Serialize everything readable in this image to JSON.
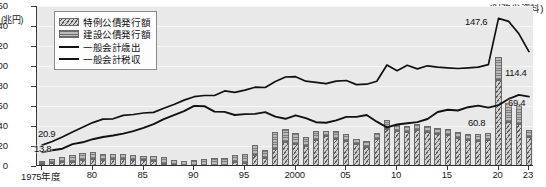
{
  "axis": {
    "y_unit": "(兆円)",
    "y_ticks": [
      0,
      20,
      40,
      60,
      80,
      100,
      120,
      140,
      160
    ],
    "x_ticks": [
      "1975年度",
      "80",
      "85",
      "90",
      "95",
      "2000",
      "05",
      "10",
      "15",
      "20",
      "23"
    ],
    "x_tick_years": [
      1975,
      1980,
      1985,
      1990,
      1995,
      2000,
      2005,
      2010,
      2015,
      2020,
      2023
    ]
  },
  "source": "(財務省資料)",
  "legend": [
    {
      "key": "toku",
      "label": "特例公債発行額",
      "type": "bar-hatch"
    },
    {
      "key": "kensetsu",
      "label": "建設公債発行額",
      "type": "bar-solid"
    },
    {
      "key": "saishutsu",
      "label": "一般会計歳出",
      "type": "line"
    },
    {
      "key": "zeishu",
      "label": "一般会計税収",
      "type": "line"
    }
  ],
  "callouts": [
    {
      "name": "saishutsu-start",
      "text": "20.9",
      "x": 38,
      "y": 128
    },
    {
      "name": "zeishu-start",
      "text": "13.8",
      "x": 34,
      "y": 143
    },
    {
      "name": "saishutsu-peak",
      "text": "147.6",
      "x": 465,
      "y": 16
    },
    {
      "name": "saishutsu-end",
      "text": "114.4",
      "x": 505,
      "y": 67
    },
    {
      "name": "zeishu-mid",
      "text": "60.8",
      "x": 468,
      "y": 117
    },
    {
      "name": "zeishu-end",
      "text": "69.4",
      "x": 508,
      "y": 97
    }
  ],
  "chart_data": {
    "type": "bar",
    "title": "",
    "subtitle": "",
    "xlabel": "",
    "ylabel": "(兆円)",
    "ylim": [
      0,
      160
    ],
    "grid": true,
    "legend_position": "top-left",
    "note": "Stacked bars = government bond issuance (special-deficit bonds hatched, construction bonds solid); two overlaid lines = general-account expenditure and tax revenue. Japan fiscal years 1975-2023, units trillion yen.",
    "categories": [
      1975,
      1976,
      1977,
      1978,
      1979,
      1980,
      1981,
      1982,
      1983,
      1984,
      1985,
      1986,
      1987,
      1988,
      1989,
      1990,
      1991,
      1992,
      1993,
      1994,
      1995,
      1996,
      1997,
      1998,
      1999,
      2000,
      2001,
      2002,
      2003,
      2004,
      2005,
      2006,
      2007,
      2008,
      2009,
      2010,
      2011,
      2012,
      2013,
      2014,
      2015,
      2016,
      2017,
      2018,
      2019,
      2020,
      2021,
      2022,
      2023
    ],
    "series": [
      {
        "name": "特例公債発行額",
        "type": "bar",
        "stack": "bonds",
        "values": [
          2.1,
          3.5,
          4.5,
          4.4,
          6.3,
          7.2,
          5.9,
          7.0,
          6.9,
          6.4,
          6.0,
          5.0,
          2.5,
          1.5,
          0.2,
          0.0,
          0.0,
          0.0,
          0.0,
          4.1,
          2.8,
          11.0,
          8.5,
          16.9,
          24.3,
          21.8,
          20.3,
          25.8,
          30.0,
          27.0,
          25.3,
          21.9,
          19.3,
          26.9,
          36.9,
          34.7,
          34.4,
          36.0,
          33.8,
          32.0,
          30.9,
          28.0,
          26.2,
          25.5,
          25.7,
          86.0,
          43.6,
          42.3,
          29.1
        ]
      },
      {
        "name": "建設公債発行額",
        "type": "bar",
        "stack": "bonds",
        "values": [
          3.1,
          3.6,
          5.0,
          6.4,
          7.1,
          7.0,
          6.0,
          5.4,
          5.1,
          4.3,
          4.3,
          4.6,
          6.9,
          5.0,
          5.2,
          6.3,
          6.7,
          7.6,
          8.1,
          6.5,
          9.4,
          10.0,
          7.1,
          17.0,
          13.2,
          11.1,
          8.7,
          9.0,
          5.4,
          8.0,
          6.5,
          5.5,
          6.0,
          6.3,
          9.0,
          6.4,
          6.1,
          5.9,
          6.2,
          6.0,
          6.0,
          6.0,
          6.1,
          6.1,
          7.1,
          22.6,
          19.0,
          20.0,
          6.6
        ]
      },
      {
        "name": "一般会計歳出",
        "type": "line",
        "values": [
          20.9,
          24.5,
          29.1,
          34.1,
          38.8,
          43.4,
          46.9,
          47.2,
          50.6,
          51.5,
          53.0,
          53.6,
          57.7,
          61.5,
          65.9,
          69.3,
          70.5,
          70.5,
          75.1,
          73.6,
          75.9,
          78.8,
          78.5,
          84.4,
          89.0,
          89.3,
          84.8,
          83.7,
          82.4,
          84.9,
          85.5,
          81.4,
          81.8,
          84.7,
          101.0,
          95.3,
          100.7,
          97.1,
          100.2,
          98.8,
          98.2,
          97.5,
          98.1,
          98.9,
          101.4,
          147.6,
          144.6,
          132.4,
          114.4
        ]
      },
      {
        "name": "一般会計税収",
        "type": "line",
        "values": [
          13.8,
          15.7,
          17.3,
          21.9,
          23.7,
          26.8,
          29.0,
          30.5,
          32.4,
          34.9,
          38.2,
          41.9,
          46.8,
          50.8,
          54.9,
          60.1,
          59.8,
          54.4,
          54.1,
          51.0,
          51.9,
          52.1,
          53.9,
          49.4,
          47.2,
          50.7,
          47.9,
          43.8,
          43.3,
          45.6,
          49.1,
          49.1,
          51.0,
          44.3,
          38.7,
          41.5,
          42.8,
          43.9,
          47.0,
          54.0,
          56.3,
          55.5,
          58.8,
          60.4,
          58.4,
          60.8,
          67.0,
          71.1,
          69.4
        ]
      }
    ]
  }
}
